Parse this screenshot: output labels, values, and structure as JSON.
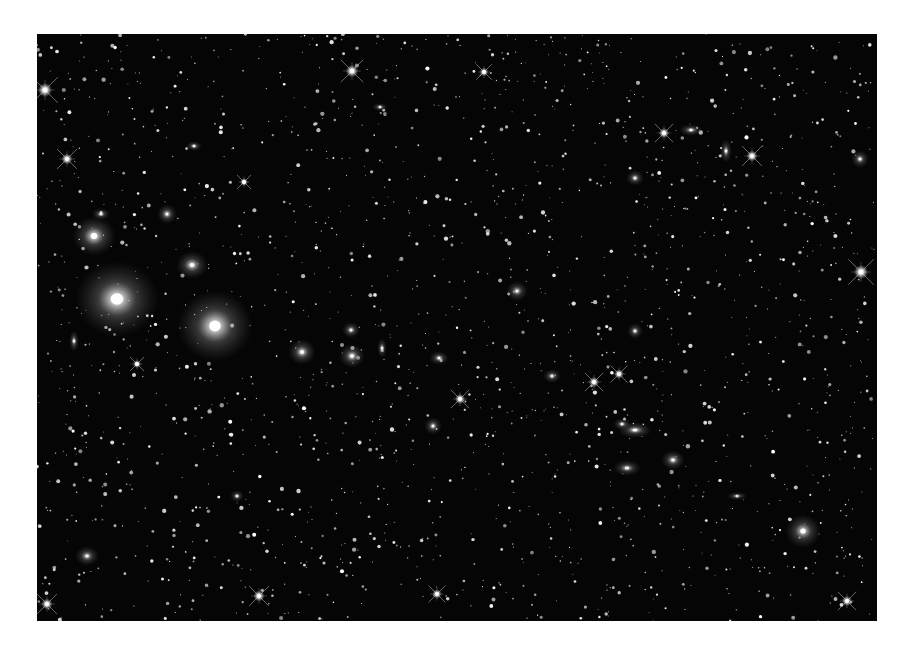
{
  "image": {
    "alt": "Grayscale deep-sky image of a dense galaxy cluster with many stars and elliptical galaxies",
    "background_color": "#050505",
    "page_background": "#ffffff",
    "frame": {
      "x": 37,
      "y": 34,
      "width": 840,
      "height": 587
    }
  },
  "field": {
    "star_count": 1900,
    "seed": 7,
    "brightness_range": [
      0.35,
      1.0
    ],
    "radius_range": [
      0.5,
      2.2
    ]
  },
  "galaxies": [
    {
      "x": 80,
      "y": 265,
      "rx": 42,
      "ry": 38,
      "core": 1.0,
      "halo": 0.55
    },
    {
      "x": 178,
      "y": 292,
      "rx": 38,
      "ry": 36,
      "core": 1.0,
      "halo": 0.5
    },
    {
      "x": 57,
      "y": 202,
      "rx": 22,
      "ry": 20,
      "core": 0.95,
      "halo": 0.45
    },
    {
      "x": 155,
      "y": 231,
      "rx": 16,
      "ry": 14,
      "core": 0.9,
      "halo": 0.4
    },
    {
      "x": 130,
      "y": 180,
      "rx": 10,
      "ry": 10,
      "core": 0.9,
      "halo": 0.35
    },
    {
      "x": 64,
      "y": 180,
      "rx": 9,
      "ry": 6,
      "core": 0.8,
      "halo": 0.3
    },
    {
      "x": 265,
      "y": 318,
      "rx": 14,
      "ry": 13,
      "core": 0.95,
      "halo": 0.4
    },
    {
      "x": 315,
      "y": 322,
      "rx": 13,
      "ry": 12,
      "core": 0.95,
      "halo": 0.4
    },
    {
      "x": 314,
      "y": 296,
      "rx": 9,
      "ry": 8,
      "core": 0.85,
      "halo": 0.35
    },
    {
      "x": 345,
      "y": 314,
      "rx": 5,
      "ry": 10,
      "core": 0.8,
      "halo": 0.3
    },
    {
      "x": 37,
      "y": 307,
      "rx": 5,
      "ry": 11,
      "core": 0.8,
      "halo": 0.3
    },
    {
      "x": 402,
      "y": 324,
      "rx": 10,
      "ry": 7,
      "core": 0.85,
      "halo": 0.3
    },
    {
      "x": 480,
      "y": 257,
      "rx": 11,
      "ry": 10,
      "core": 0.85,
      "halo": 0.3
    },
    {
      "x": 515,
      "y": 342,
      "rx": 9,
      "ry": 7,
      "core": 0.8,
      "halo": 0.3
    },
    {
      "x": 598,
      "y": 396,
      "rx": 17,
      "ry": 8,
      "core": 0.9,
      "halo": 0.35
    },
    {
      "x": 585,
      "y": 390,
      "rx": 9,
      "ry": 6,
      "core": 0.85,
      "halo": 0.3
    },
    {
      "x": 636,
      "y": 426,
      "rx": 12,
      "ry": 10,
      "core": 0.9,
      "halo": 0.35
    },
    {
      "x": 590,
      "y": 434,
      "rx": 14,
      "ry": 8,
      "core": 0.85,
      "halo": 0.3
    },
    {
      "x": 654,
      "y": 96,
      "rx": 12,
      "ry": 6,
      "core": 0.85,
      "halo": 0.3
    },
    {
      "x": 598,
      "y": 144,
      "rx": 9,
      "ry": 8,
      "core": 0.85,
      "halo": 0.3
    },
    {
      "x": 689,
      "y": 117,
      "rx": 6,
      "ry": 12,
      "core": 0.85,
      "halo": 0.3
    },
    {
      "x": 823,
      "y": 125,
      "rx": 9,
      "ry": 9,
      "core": 0.85,
      "halo": 0.3
    },
    {
      "x": 766,
      "y": 497,
      "rx": 18,
      "ry": 17,
      "core": 0.95,
      "halo": 0.4
    },
    {
      "x": 700,
      "y": 462,
      "rx": 10,
      "ry": 4,
      "core": 0.75,
      "halo": 0.25
    },
    {
      "x": 396,
      "y": 392,
      "rx": 9,
      "ry": 9,
      "core": 0.85,
      "halo": 0.3
    },
    {
      "x": 598,
      "y": 297,
      "rx": 8,
      "ry": 8,
      "core": 0.8,
      "halo": 0.3
    },
    {
      "x": 157,
      "y": 112,
      "rx": 8,
      "ry": 5,
      "core": 0.8,
      "halo": 0.3
    },
    {
      "x": 343,
      "y": 73,
      "rx": 8,
      "ry": 4,
      "core": 0.75,
      "halo": 0.25
    },
    {
      "x": 50,
      "y": 522,
      "rx": 12,
      "ry": 10,
      "core": 0.8,
      "halo": 0.3
    },
    {
      "x": 200,
      "y": 462,
      "rx": 7,
      "ry": 6,
      "core": 0.8,
      "halo": 0.25
    }
  ],
  "spiked_stars": [
    {
      "x": 8,
      "y": 56,
      "size": 18
    },
    {
      "x": 315,
      "y": 37,
      "size": 16
    },
    {
      "x": 30,
      "y": 125,
      "size": 14
    },
    {
      "x": 627,
      "y": 99,
      "size": 13
    },
    {
      "x": 715,
      "y": 122,
      "size": 14
    },
    {
      "x": 824,
      "y": 238,
      "size": 18
    },
    {
      "x": 423,
      "y": 365,
      "size": 13
    },
    {
      "x": 557,
      "y": 348,
      "size": 13
    },
    {
      "x": 582,
      "y": 340,
      "size": 12
    },
    {
      "x": 222,
      "y": 562,
      "size": 14
    },
    {
      "x": 400,
      "y": 560,
      "size": 12
    },
    {
      "x": 10,
      "y": 570,
      "size": 14
    },
    {
      "x": 810,
      "y": 567,
      "size": 13
    },
    {
      "x": 447,
      "y": 38,
      "size": 11
    },
    {
      "x": 207,
      "y": 148,
      "size": 10
    },
    {
      "x": 100,
      "y": 330,
      "size": 10
    }
  ]
}
